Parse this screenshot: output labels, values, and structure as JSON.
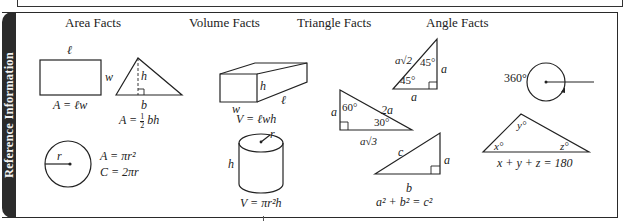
{
  "side_label": "Reference Information",
  "sections": {
    "area": {
      "title": "Area Facts",
      "rectangle": {
        "top_label": "ℓ",
        "side_label": "w",
        "formula": "A = ℓw"
      },
      "triangle": {
        "height_label": "h",
        "base_label": "b",
        "formula_prefix": "A = ",
        "formula_fraction_num": "1",
        "formula_fraction_den": "2",
        "formula_suffix": " bh"
      },
      "circle": {
        "radius_label": "r",
        "area_formula": "A = πr²",
        "circumference_formula": "C = 2πr"
      }
    },
    "volume": {
      "title": "Volume Facts",
      "box": {
        "height_label": "h",
        "width_label": "w",
        "length_label": "ℓ",
        "formula": "V = ℓwh"
      },
      "cylinder": {
        "radius_label": "r",
        "height_label": "h",
        "formula": "V = πr²h"
      }
    },
    "triangle": {
      "title": "Triangle Facts",
      "isosceles_right": {
        "hypotenuse_label": "a√2",
        "top_angle": "45°",
        "bottom_angle": "45°",
        "leg_right_label": "a",
        "leg_bottom_label": "a"
      },
      "thirty_sixty_ninety": {
        "left_label": "a",
        "top_angle": "60°",
        "hypotenuse_label": "2a",
        "bottom_angle": "30°",
        "base_label": "a√3"
      },
      "pythagorean": {
        "hypotenuse_label": "c",
        "leg_right_label": "a",
        "base_label": "b",
        "formula": "a² + b² = c²"
      }
    },
    "angle": {
      "title": "Angle Facts",
      "circle": {
        "label": "360°"
      },
      "triangle": {
        "x_label": "x°",
        "y_label": "y°",
        "z_label": "z°",
        "formula": "x + y + z = 180"
      }
    }
  }
}
